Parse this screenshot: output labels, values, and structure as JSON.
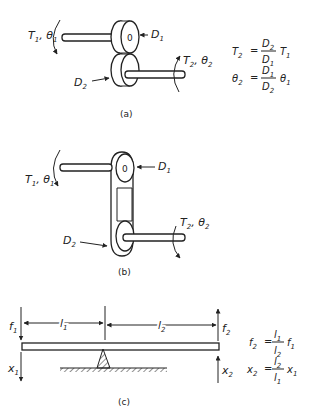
{
  "panels": {
    "a": {
      "caption": "(a)",
      "input_label": {
        "T": "T",
        "T_sub": "1",
        "theta": "θ",
        "theta_sub": "1"
      },
      "output_label": {
        "T": "T",
        "T_sub": "2",
        "theta": "θ",
        "theta_sub": "2"
      },
      "d1_label": {
        "D": "D",
        "sub": "1"
      },
      "d2_label": {
        "D": "D",
        "sub": "2"
      },
      "hub_mark": "0",
      "equations": [
        {
          "lhs": "T",
          "lhs_sub": "2",
          "num": "D",
          "num_sub": "2",
          "den": "D",
          "den_sub": "1",
          "rhs": "T",
          "rhs_sub": "1"
        },
        {
          "lhs": "θ",
          "lhs_sub": "2",
          "num": "D",
          "num_sub": "1",
          "den": "D",
          "den_sub": "2",
          "rhs": "θ",
          "rhs_sub": "1"
        }
      ]
    },
    "b": {
      "caption": "(b)",
      "input_label": {
        "T": "T",
        "T_sub": "1",
        "theta": "θ",
        "theta_sub": "1"
      },
      "output_label": {
        "T": "T",
        "T_sub": "2",
        "theta": "θ",
        "theta_sub": "2"
      },
      "d1_label": {
        "D": "D",
        "sub": "1"
      },
      "d2_label": {
        "D": "D",
        "sub": "2"
      },
      "hub_mark": "0"
    },
    "c": {
      "caption": "(c)",
      "f1": {
        "f": "f",
        "sub": "1"
      },
      "f2": {
        "f": "f",
        "sub": "2"
      },
      "x1": {
        "x": "x",
        "sub": "1"
      },
      "x2": {
        "x": "x",
        "sub": "2"
      },
      "l1": {
        "l": "l",
        "sub": "1"
      },
      "l2": {
        "l": "l",
        "sub": "2"
      },
      "equations": [
        {
          "lhs": "f",
          "lhs_sub": "2",
          "num": "l",
          "num_sub": "1",
          "den": "l",
          "den_sub": "2",
          "rhs": "f",
          "rhs_sub": "1"
        },
        {
          "lhs": "x",
          "lhs_sub": "2",
          "num": "l",
          "num_sub": "2",
          "den": "l",
          "den_sub": "1",
          "rhs": "x",
          "rhs_sub": "1"
        }
      ]
    }
  },
  "eq_sign": "="
}
